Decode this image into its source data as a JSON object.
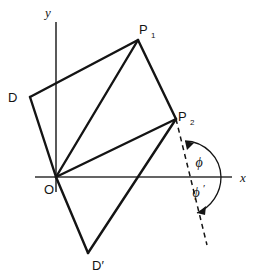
{
  "figure": {
    "stroke_color": "#141414",
    "axis_color": "#303030",
    "background": "#ffffff"
  },
  "axes": {
    "x_axis": {
      "label": "x",
      "from": [
        35,
        177
      ],
      "to": [
        232,
        177
      ]
    },
    "y_axis": {
      "label": "y",
      "from": [
        56,
        22
      ],
      "to": [
        56,
        192
      ]
    }
  },
  "points": {
    "origin": {
      "label": "O",
      "x": 56,
      "y": 177,
      "label_x": 44,
      "label_y": 192
    },
    "P1": {
      "label": "P",
      "subscript": "1",
      "x": 138,
      "y": 40,
      "label_x": 140,
      "label_y": 33,
      "sub_x": 151,
      "sub_y": 37
    },
    "P2": {
      "label": "P",
      "subscript": "2",
      "x": 176,
      "y": 119,
      "label_x": 178,
      "label_y": 119,
      "sub_x": 189,
      "sub_y": 123
    },
    "D": {
      "label": "D",
      "x": 30,
      "y": 97,
      "label_x": 9,
      "label_y": 101
    },
    "Dprime": {
      "label": "D′",
      "x": 88,
      "y": 253,
      "label_x": 93,
      "label_y": 268
    }
  },
  "edges": [
    {
      "name": "D-to-P1",
      "from": [
        30,
        97
      ],
      "to": [
        138,
        40
      ]
    },
    {
      "name": "P1-to-P2",
      "from": [
        138,
        40
      ],
      "to": [
        176,
        119
      ]
    },
    {
      "name": "O-to-D",
      "from": [
        56,
        177
      ],
      "to": [
        30,
        97
      ]
    },
    {
      "name": "O-to-P1",
      "from": [
        56,
        177
      ],
      "to": [
        138,
        40
      ]
    },
    {
      "name": "O-to-P2",
      "from": [
        56,
        177
      ],
      "to": [
        176,
        119
      ]
    },
    {
      "name": "O-to-Dprime",
      "from": [
        56,
        177
      ],
      "to": [
        88,
        253
      ]
    },
    {
      "name": "Dprime-to-P2",
      "from": [
        88,
        253
      ],
      "to": [
        176,
        119
      ]
    }
  ],
  "dashed_line": {
    "name": "rotated-axis",
    "from": [
      176,
      119
    ],
    "to": [
      207,
      245
    ],
    "style": "dashed"
  },
  "angles": [
    {
      "name": "phi",
      "label": "ϕ",
      "label_x": 199,
      "label_y": 163,
      "position": "above-axis",
      "arrow": "counterclockwise-to-dashed-line"
    },
    {
      "name": "phi-prime",
      "label": "ϕ",
      "prime": "′",
      "label_x": 198,
      "label_y": 192,
      "position": "below-axis",
      "arrow": "clockwise-to-dashed-line"
    }
  ]
}
